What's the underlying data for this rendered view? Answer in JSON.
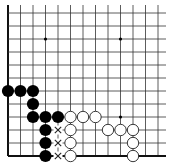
{
  "board": {
    "grid": {
      "columns": 13,
      "rows": 12,
      "origin_x": 8,
      "origin_y": 13,
      "spacing_x": 12.5,
      "spacing_y": 13,
      "right_extent": 166,
      "top_extent": 5,
      "open_edges": [
        "top",
        "right"
      ],
      "closed_edges": [
        "left",
        "bottom"
      ]
    },
    "colors": {
      "background": "#ffffff",
      "line": "#333333",
      "edge_line": "#111111",
      "black_stone": "#000000",
      "white_stone_fill": "#ffffff",
      "white_stone_stroke": "#222222",
      "mark": "#222222"
    },
    "star_points": [
      {
        "col": 3,
        "row": 2
      },
      {
        "col": 9,
        "row": 2
      },
      {
        "col": 9,
        "row": 8
      }
    ],
    "black_stones": [
      {
        "col": 0,
        "row": 6
      },
      {
        "col": 1,
        "row": 6
      },
      {
        "col": 2,
        "row": 6
      },
      {
        "col": 2,
        "row": 7
      },
      {
        "col": 2,
        "row": 8
      },
      {
        "col": 3,
        "row": 8
      },
      {
        "col": 4,
        "row": 8
      },
      {
        "col": 3,
        "row": 9
      },
      {
        "col": 3,
        "row": 10
      },
      {
        "col": 3,
        "row": 11
      }
    ],
    "white_stones": [
      {
        "col": 5,
        "row": 8
      },
      {
        "col": 6,
        "row": 8
      },
      {
        "col": 7,
        "row": 8
      },
      {
        "col": 5,
        "row": 9
      },
      {
        "col": 8,
        "row": 9
      },
      {
        "col": 9,
        "row": 9
      },
      {
        "col": 10,
        "row": 9
      },
      {
        "col": 5,
        "row": 10
      },
      {
        "col": 10,
        "row": 10
      },
      {
        "col": 5,
        "row": 11
      },
      {
        "col": 10,
        "row": 11
      }
    ],
    "marks": [
      {
        "col": 4,
        "row": 9,
        "symbol": "x"
      },
      {
        "col": 4,
        "row": 10,
        "symbol": "x"
      },
      {
        "col": 4,
        "row": 11,
        "symbol": "x"
      }
    ]
  }
}
